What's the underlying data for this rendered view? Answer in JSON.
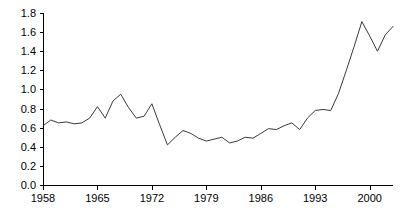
{
  "chart_data": {
    "type": "line",
    "title": "",
    "subtitle": "",
    "xlabel": "",
    "ylabel": "",
    "xlim": [
      1958,
      2003
    ],
    "ylim": [
      0.0,
      1.8
    ],
    "grid": false,
    "legend": null,
    "y_ticks": [
      "1.8",
      "1.6",
      "1.4",
      "1.2",
      "1.0",
      "0.8",
      "0.6",
      "0.4",
      "0.2",
      "0.0"
    ],
    "y_tick_values": [
      1.8,
      1.6,
      1.4,
      1.2,
      1.0,
      0.8,
      0.6,
      0.4,
      0.2,
      0.0
    ],
    "x_ticks": [
      "1958",
      "1965",
      "1972",
      "1979",
      "1986",
      "1993",
      "2000"
    ],
    "x_tick_values": [
      1958,
      1965,
      1972,
      1979,
      1986,
      1993,
      2000
    ],
    "series": [
      {
        "name": "",
        "color": "#3a3a3a",
        "x": [
          1958,
          1959,
          1960,
          1961,
          1962,
          1963,
          1964,
          1965,
          1966,
          1967,
          1968,
          1969,
          1970,
          1971,
          1972,
          1973,
          1974,
          1975,
          1976,
          1977,
          1978,
          1979,
          1980,
          1981,
          1982,
          1983,
          1984,
          1985,
          1986,
          1987,
          1988,
          1989,
          1990,
          1991,
          1992,
          1993,
          1994,
          1995,
          1996,
          1997,
          1998,
          1999,
          2000,
          2001,
          2002,
          2003
        ],
        "values": [
          0.62,
          0.68,
          0.65,
          0.66,
          0.64,
          0.65,
          0.7,
          0.82,
          0.7,
          0.88,
          0.95,
          0.81,
          0.7,
          0.72,
          0.85,
          0.63,
          0.42,
          0.5,
          0.57,
          0.54,
          0.49,
          0.46,
          0.48,
          0.5,
          0.44,
          0.46,
          0.5,
          0.49,
          0.54,
          0.59,
          0.58,
          0.62,
          0.65,
          0.58,
          0.7,
          0.78,
          0.79,
          0.78,
          0.96,
          1.2,
          1.45,
          1.71,
          1.56,
          1.4,
          1.57,
          1.66
        ]
      }
    ]
  },
  "axes": {
    "plot_left_px": 43,
    "plot_right_px": 393,
    "plot_top_px": 13,
    "plot_bottom_px": 185
  }
}
